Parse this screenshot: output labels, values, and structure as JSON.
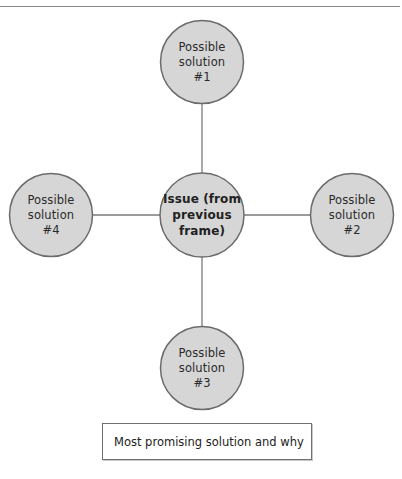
{
  "diagram": {
    "type": "hub-and-spoke",
    "colors": {
      "node_fill": "#d6d6d6",
      "node_stroke": "#6b6b6b",
      "connector": "#7a7a7a",
      "rule": "#8a8a8a"
    },
    "center": {
      "lines": [
        "Issue (from",
        "previous",
        "frame)"
      ]
    },
    "solutions": [
      {
        "id": "1",
        "position": "top",
        "lines": [
          "Possible",
          "solution",
          "#1"
        ]
      },
      {
        "id": "2",
        "position": "right",
        "lines": [
          "Possible",
          "solution",
          "#2"
        ]
      },
      {
        "id": "3",
        "position": "bottom",
        "lines": [
          "Possible",
          "solution",
          "#3"
        ]
      },
      {
        "id": "4",
        "position": "left",
        "lines": [
          "Possible",
          "solution",
          "#4"
        ]
      }
    ],
    "answer_box": {
      "label": "Most promising solution and why"
    }
  }
}
